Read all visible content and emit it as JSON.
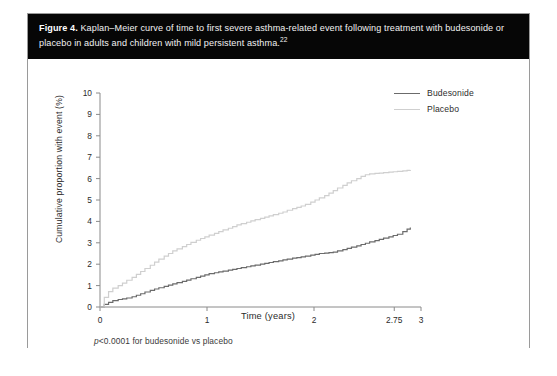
{
  "figure": {
    "label": "Figure 4.",
    "caption": " Kaplan–Meier curve of time to first severe asthma-related event following treatment with budesonide or placebo in adults and children with mild persistent asthma.",
    "reference": "22",
    "footnote_italic": "p",
    "footnote_rest": "<0.0001 for budesonide vs placebo"
  },
  "legend": {
    "position": "top-right",
    "items": [
      {
        "label": "Budesonide",
        "color": "#6b6b6b"
      },
      {
        "label": "Placebo",
        "color": "#cfcfcf"
      }
    ]
  },
  "chart_data": {
    "type": "line",
    "title": "",
    "xlabel": "Time (years)",
    "ylabel": "Cumulative proportion with event (%)",
    "xlim": [
      0,
      3
    ],
    "ylim": [
      0,
      10
    ],
    "xticks": [
      0,
      1,
      2,
      2.75,
      3
    ],
    "xticklabels": [
      "0",
      "1",
      "2",
      "2.75",
      "3"
    ],
    "yticks": [
      0,
      1,
      2,
      3,
      4,
      5,
      6,
      7,
      8,
      9,
      10
    ],
    "yticklabels": [
      "0",
      "1",
      "2",
      "3",
      "4",
      "5",
      "6",
      "7",
      "8",
      "9",
      "10"
    ],
    "grid": false,
    "legend_position": "top-right",
    "series": [
      {
        "name": "Budesonide",
        "color": "#6b6b6b",
        "style": "step",
        "x": [
          0.0,
          0.04,
          0.08,
          0.12,
          0.17,
          0.21,
          0.25,
          0.3,
          0.34,
          0.38,
          0.42,
          0.47,
          0.51,
          0.55,
          0.6,
          0.64,
          0.68,
          0.72,
          0.77,
          0.81,
          0.85,
          0.9,
          0.94,
          0.98,
          1.02,
          1.07,
          1.11,
          1.15,
          1.2,
          1.24,
          1.28,
          1.32,
          1.37,
          1.41,
          1.45,
          1.5,
          1.54,
          1.58,
          1.62,
          1.67,
          1.71,
          1.75,
          1.8,
          1.84,
          1.88,
          1.92,
          1.97,
          2.01,
          2.05,
          2.1,
          2.14,
          2.18,
          2.22,
          2.27,
          2.31,
          2.35,
          2.4,
          2.44,
          2.48,
          2.52,
          2.57,
          2.61,
          2.65,
          2.7,
          2.74,
          2.78,
          2.83,
          2.87,
          2.9
        ],
        "y": [
          0.0,
          0.12,
          0.22,
          0.3,
          0.35,
          0.38,
          0.42,
          0.48,
          0.55,
          0.62,
          0.7,
          0.78,
          0.84,
          0.9,
          0.96,
          1.02,
          1.08,
          1.14,
          1.2,
          1.26,
          1.32,
          1.38,
          1.44,
          1.5,
          1.56,
          1.6,
          1.64,
          1.68,
          1.72,
          1.76,
          1.8,
          1.84,
          1.88,
          1.92,
          1.96,
          2.0,
          2.04,
          2.08,
          2.12,
          2.16,
          2.2,
          2.24,
          2.28,
          2.31,
          2.34,
          2.38,
          2.42,
          2.46,
          2.5,
          2.52,
          2.54,
          2.56,
          2.62,
          2.68,
          2.74,
          2.8,
          2.86,
          2.92,
          2.98,
          3.04,
          3.1,
          3.16,
          3.22,
          3.28,
          3.34,
          3.4,
          3.52,
          3.64,
          3.72
        ]
      },
      {
        "name": "Placebo",
        "color": "#cfcfcf",
        "style": "step",
        "x": [
          0.0,
          0.04,
          0.08,
          0.12,
          0.17,
          0.21,
          0.25,
          0.3,
          0.34,
          0.38,
          0.42,
          0.47,
          0.51,
          0.55,
          0.6,
          0.64,
          0.68,
          0.72,
          0.77,
          0.81,
          0.85,
          0.9,
          0.94,
          0.98,
          1.02,
          1.07,
          1.11,
          1.15,
          1.2,
          1.24,
          1.28,
          1.32,
          1.37,
          1.41,
          1.45,
          1.5,
          1.54,
          1.58,
          1.62,
          1.67,
          1.71,
          1.75,
          1.8,
          1.84,
          1.88,
          1.92,
          1.97,
          2.01,
          2.05,
          2.1,
          2.14,
          2.18,
          2.22,
          2.27,
          2.31,
          2.35,
          2.4,
          2.44,
          2.48,
          2.52,
          2.57,
          2.61,
          2.65,
          2.7,
          2.74,
          2.78,
          2.83,
          2.87,
          2.9
        ],
        "y": [
          0.0,
          0.45,
          0.72,
          0.88,
          1.0,
          1.12,
          1.25,
          1.38,
          1.52,
          1.66,
          1.8,
          1.95,
          2.1,
          2.24,
          2.38,
          2.5,
          2.62,
          2.72,
          2.82,
          2.92,
          3.02,
          3.12,
          3.2,
          3.28,
          3.36,
          3.44,
          3.52,
          3.6,
          3.68,
          3.76,
          3.84,
          3.9,
          3.96,
          4.02,
          4.08,
          4.14,
          4.2,
          4.26,
          4.32,
          4.38,
          4.44,
          4.52,
          4.6,
          4.66,
          4.72,
          4.8,
          4.9,
          5.0,
          5.1,
          5.2,
          5.32,
          5.44,
          5.56,
          5.68,
          5.8,
          5.9,
          6.0,
          6.1,
          6.18,
          6.22,
          6.24,
          6.26,
          6.28,
          6.3,
          6.32,
          6.34,
          6.36,
          6.38,
          6.4
        ]
      }
    ]
  }
}
